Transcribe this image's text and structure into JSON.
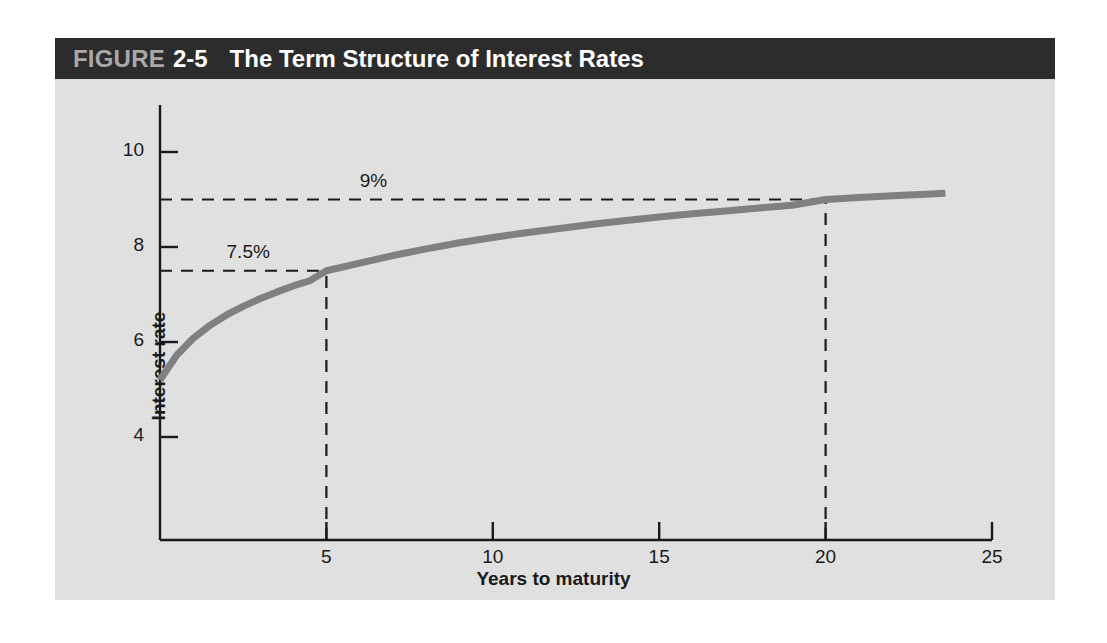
{
  "figure": {
    "label_word": "FIGURE",
    "number": "2-5",
    "title": "The Term Structure of Interest Rates",
    "header_bg": "#2c2c2c",
    "panel_bg": "#e4e4e4",
    "label_word_color": "#a9a9a9",
    "title_color": "#ffffff"
  },
  "chart_data": {
    "type": "line",
    "title": "The Term Structure of Interest Rates",
    "xlabel": "Years to maturity",
    "ylabel": "Interest rate",
    "xlim": [
      0,
      25
    ],
    "ylim": [
      3,
      10.8
    ],
    "xticks": [
      5,
      10,
      15,
      20,
      25
    ],
    "yticks": [
      4,
      6,
      8,
      10
    ],
    "xtick_labels": [
      "5",
      "10",
      "15",
      "20",
      "25"
    ],
    "ytick_labels": [
      "4",
      "6",
      "8",
      "10"
    ],
    "grid": false,
    "legend": false,
    "series": [
      {
        "name": "Yield curve",
        "color": "#808080",
        "line_width": 7,
        "x": [
          0.0,
          0.5,
          1.0,
          1.5,
          2.0,
          2.5,
          3.0,
          3.5,
          4.0,
          4.5,
          5.0,
          6.0,
          7.0,
          8.0,
          9.0,
          10.0,
          11.0,
          12.0,
          13.0,
          14.0,
          15.0,
          16.0,
          17.0,
          18.0,
          19.0,
          20.0,
          21.0,
          22.0,
          23.0,
          23.6
        ],
        "y": [
          5.2,
          5.72,
          6.08,
          6.35,
          6.57,
          6.75,
          6.91,
          7.05,
          7.18,
          7.29,
          7.5,
          7.66,
          7.82,
          7.96,
          8.09,
          8.2,
          8.3,
          8.39,
          8.48,
          8.56,
          8.63,
          8.7,
          8.76,
          8.82,
          8.88,
          9.0,
          9.04,
          9.08,
          9.11,
          9.13
        ]
      }
    ],
    "annotations": [
      {
        "text": "9%",
        "x": 6.0,
        "y": 9.35,
        "refers_to_value": 9
      },
      {
        "text": "7.5%",
        "x": 2.0,
        "y": 7.85,
        "refers_to_value": 7.5
      }
    ],
    "reference_lines": [
      {
        "orientation": "horizontal",
        "value": 9,
        "from": 0,
        "to": 20,
        "style": "dashed"
      },
      {
        "orientation": "horizontal",
        "value": 7.5,
        "from": 0,
        "to": 5,
        "style": "dashed"
      },
      {
        "orientation": "vertical",
        "value": 5,
        "from": 3,
        "to": 7.5,
        "style": "dashed"
      },
      {
        "orientation": "vertical",
        "value": 20,
        "from": 3,
        "to": 9,
        "style": "dashed"
      }
    ],
    "marked_points": [
      {
        "x": 5,
        "y": 7.5,
        "label": "7.5%"
      },
      {
        "x": 20,
        "y": 9,
        "label": "9%"
      }
    ]
  }
}
